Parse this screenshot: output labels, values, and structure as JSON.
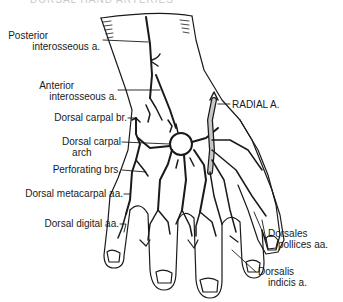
{
  "title": "DORSAL HAND ARTERIES",
  "labels": {
    "posterior_interosseous": [
      "Posterior",
      "interosseous a."
    ],
    "anterior_interosseous": [
      "Anterior",
      "interosseous a."
    ],
    "dorsal_carpal_br": "Dorsal carpal br.",
    "dorsal_carpal_arch": [
      "Dorsal carpal",
      "arch"
    ],
    "perforating_brs": "Perforating brs.",
    "dorsal_metacarpal": "Dorsal metacarpal aa.",
    "dorsal_digital": "Dorsal digital aa.",
    "radial_a": "RADIAL A.",
    "dorsales_pollices": [
      "Dorsales",
      "pollices aa."
    ],
    "dorsalis_indicis": [
      "Dorsalis",
      "indicis a."
    ]
  },
  "colors": {
    "ink": "#1a1a1a",
    "radial_fill": "#c8c8c8"
  }
}
